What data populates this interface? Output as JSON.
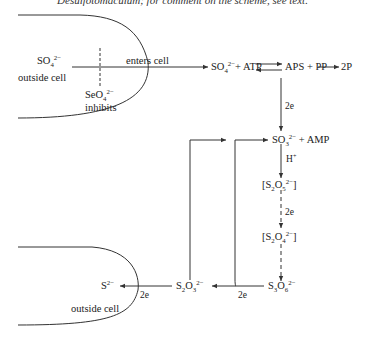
{
  "caption": "Desulfotomaculum; for comment on the scheme, see text.",
  "upper_cell": {
    "outside_label_1": "SO",
    "outside_label_1_sub": "4",
    "outside_label_1_sup": "2−",
    "outside_label_2": "outside cell",
    "enters_label": "enters cell",
    "inhibitor": "SeO",
    "inhibitor_sub": "4",
    "inhibitor_sup": "2−",
    "inhibitor_label": "inhibits"
  },
  "pathway": {
    "step1": {
      "a": "SO",
      "a_sub": "4",
      "a_sup": "2−",
      "rest": "+ ATP"
    },
    "step2": "APS + PP",
    "step2_product": "2P",
    "e1": "2e",
    "step3": {
      "a": "SO",
      "a_sub": "3",
      "a_sup": "2−",
      "rest": " + AMP"
    },
    "proton": "H",
    "proton_sup": "+",
    "step4": {
      "open": "[S",
      "s1": "2",
      "mid": "O",
      "s2": "5",
      "sup": "2−",
      "close": "]"
    },
    "e2": "2e",
    "step5": {
      "open": "[S",
      "s1": "2",
      "mid": "O",
      "s2": "4",
      "sup": "2−",
      "close": "]"
    },
    "step6": {
      "a": "S",
      "s1": "3",
      "mid": "O",
      "s2": "6",
      "sup": "2−"
    },
    "e3": "2e",
    "step7": {
      "a": "S",
      "s1": "2",
      "mid": "O",
      "s2": "3",
      "sup": "2−"
    },
    "e4": "2e",
    "step8": {
      "a": "S",
      "sup": "2−"
    }
  },
  "lower_cell": {
    "outside_label": "outside cell"
  },
  "colors": {
    "line": "#333333",
    "text": "#222222",
    "background": "#ffffff"
  }
}
